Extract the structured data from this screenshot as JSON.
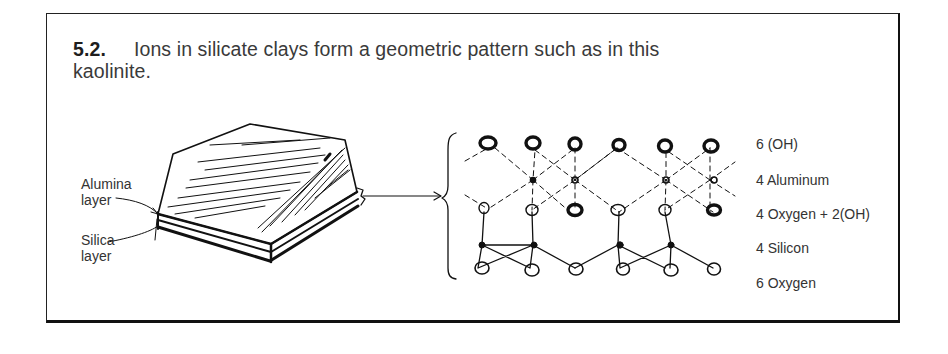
{
  "figure": {
    "number": "5.2.",
    "caption_line1": "Ions in silicate clays form a geometric pattern such as in this",
    "caption_line2": "kaolinite."
  },
  "crystal_labels": {
    "alumina_line1": "Alumina",
    "alumina_line2": "layer",
    "silica_line1": "Silica",
    "silica_line2": "layer"
  },
  "structure_legend": [
    {
      "label": "6 (OH)"
    },
    {
      "label": "4 Aluminum"
    },
    {
      "label": "4 Oxygen + 2(OH)"
    },
    {
      "label": "4 Silicon"
    },
    {
      "label": "6 Oxygen"
    }
  ]
}
